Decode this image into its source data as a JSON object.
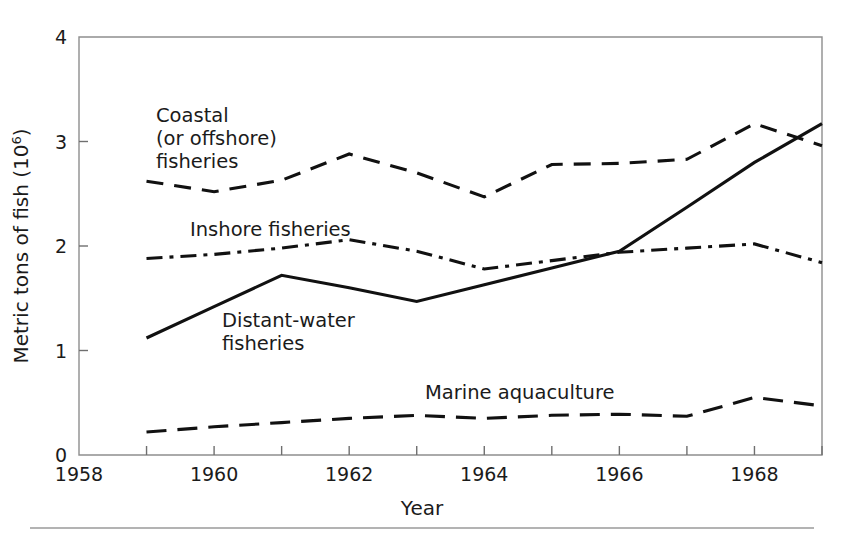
{
  "figure": {
    "background_color": "#ffffff",
    "ink_color": "#111111",
    "axis_color": "#8e8e8e",
    "footer_rule": true
  },
  "chart_data": {
    "type": "line",
    "title": "",
    "xlabel": "Year",
    "ylabel": "Metric tons of fish (10⁶)",
    "ylabel_base": "Metric tons of fish (10",
    "ylabel_exponent": "6",
    "ylabel_close": ")",
    "xlim": [
      1958,
      1969
    ],
    "ylim": [
      0,
      4
    ],
    "grid": false,
    "legend_position": "inline-annotations",
    "x_ticks": [
      1958,
      1959,
      1960,
      1961,
      1962,
      1963,
      1964,
      1965,
      1966,
      1967,
      1968,
      1969
    ],
    "x_tick_labels": [
      "1958",
      "",
      "1960",
      "",
      "1962",
      "",
      "1964",
      "",
      "1966",
      "",
      "1968",
      ""
    ],
    "y_ticks": [
      0,
      1,
      2,
      3,
      4
    ],
    "y_tick_labels": [
      "0",
      "1",
      "2",
      "3",
      "4"
    ],
    "x": [
      1959,
      1960,
      1961,
      1962,
      1963,
      1964,
      1965,
      1966,
      1967,
      1968,
      1969
    ],
    "series": [
      {
        "name": "Coastal (or offshore) fisheries",
        "style": "dashed",
        "dasharray": "17,11",
        "values": [
          2.62,
          2.52,
          2.63,
          2.88,
          2.7,
          2.47,
          2.78,
          2.79,
          2.83,
          3.17,
          2.96
        ]
      },
      {
        "name": "Inshore fisheries",
        "style": "dash-dot",
        "dasharray": "16,7,4,7",
        "values": [
          1.88,
          1.92,
          1.98,
          2.06,
          1.95,
          1.78,
          1.86,
          1.94,
          1.98,
          2.02,
          1.84
        ]
      },
      {
        "name": "Distant-water fisheries",
        "style": "solid",
        "dasharray": "none",
        "values": [
          1.12,
          1.42,
          1.72,
          1.6,
          1.47,
          1.63,
          1.79,
          1.95,
          2.37,
          2.8,
          3.17
        ]
      },
      {
        "name": "Marine aquaculture",
        "style": "long-dashed",
        "dasharray": "20,11",
        "values": [
          0.22,
          0.27,
          0.31,
          0.35,
          0.38,
          0.35,
          0.38,
          0.39,
          0.37,
          0.55,
          0.47
        ]
      }
    ],
    "annotations": [
      {
        "id": "coastal",
        "lines": [
          "Coastal",
          "(or offshore)",
          "fisheries"
        ],
        "x_px": 156,
        "y_px": 122
      },
      {
        "id": "inshore",
        "lines": [
          "Inshore fisheries"
        ],
        "x_px": 190,
        "y_px": 236
      },
      {
        "id": "distant-water",
        "lines": [
          "Distant-water",
          "fisheries"
        ],
        "x_px": 222,
        "y_px": 327
      },
      {
        "id": "marine-aquaculture",
        "lines": [
          "Marine aquaculture"
        ],
        "x_px": 425,
        "y_px": 399
      }
    ]
  }
}
